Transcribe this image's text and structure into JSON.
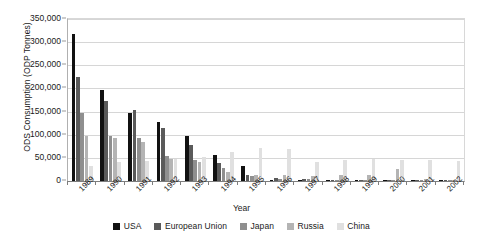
{
  "chart_data": {
    "type": "bar",
    "title": "",
    "xlabel": "Year",
    "ylabel": "ODS Consumption (ODP Tonnes)",
    "ylim": [
      0,
      350000
    ],
    "ytick_step": 50000,
    "ytick_labels": [
      "350,000",
      "300,000",
      "250,000",
      "200,000",
      "150,000",
      "100,000",
      "50,000",
      "0"
    ],
    "ytick_values": [
      350000,
      300000,
      250000,
      200000,
      150000,
      100000,
      50000,
      0
    ],
    "grid": true,
    "legend_position": "bottom",
    "categories": [
      "1989",
      "1990",
      "1991",
      "1992",
      "1993",
      "1994",
      "1995",
      "1996",
      "1997",
      "1998",
      "1999",
      "2000",
      "2001",
      "2002"
    ],
    "series": [
      {
        "name": "USA",
        "color": "#111111",
        "values": [
          318000,
          197000,
          148000,
          128000,
          98000,
          57000,
          32000,
          3000,
          2000,
          1500,
          1200,
          1000,
          900,
          800
        ]
      },
      {
        "name": "European Union",
        "color": "#5a5a5a",
        "values": [
          225000,
          172000,
          154000,
          115000,
          78000,
          38000,
          13000,
          6000,
          4000,
          3000,
          2500,
          2000,
          1500,
          1200
        ]
      },
      {
        "name": "Japan",
        "color": "#8f8f8f",
        "values": [
          146000,
          98000,
          93000,
          54000,
          45000,
          28000,
          10000,
          5000,
          4000,
          3000,
          2500,
          2000,
          1500,
          1200
        ]
      },
      {
        "name": "Russia",
        "color": "#b4b4b4",
        "values": [
          98000,
          93000,
          84000,
          48000,
          42000,
          20000,
          13000,
          13000,
          11000,
          13000,
          14000,
          27000,
          4000,
          3000
        ]
      },
      {
        "name": "China",
        "color": "#e0e0e0",
        "values": [
          33000,
          41000,
          43000,
          47000,
          52000,
          63000,
          72000,
          70000,
          42000,
          45000,
          48000,
          46000,
          45000,
          44000
        ]
      }
    ]
  },
  "legend": {
    "items": [
      {
        "label": "USA",
        "color": "#111111"
      },
      {
        "label": "European Union",
        "color": "#5a5a5a"
      },
      {
        "label": "Japan",
        "color": "#8f8f8f"
      },
      {
        "label": "Russia",
        "color": "#b4b4b4"
      },
      {
        "label": "China",
        "color": "#e0e0e0"
      }
    ]
  }
}
